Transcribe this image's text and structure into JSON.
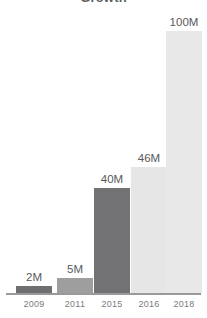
{
  "chart_data": {
    "type": "bar",
    "title": "Growth",
    "subtitle": "",
    "xlabel": "",
    "ylabel": "",
    "categories": [
      "2009",
      "2011",
      "2015",
      "2016",
      "2018"
    ],
    "values": [
      2,
      5,
      40,
      46,
      100
    ],
    "value_labels": [
      "2M",
      "5M",
      "40M",
      "46M",
      "100M"
    ],
    "unit": "M",
    "ylim": [
      0,
      100
    ],
    "grid": false,
    "legend": false,
    "legend_position": "none",
    "bar_colors": [
      "#6f6f71",
      "#9e9e9f",
      "#727274",
      "#e6e6e6",
      "#e8e8e8"
    ],
    "series": [
      {
        "name": "Growth",
        "values": [
          2,
          5,
          40,
          46,
          100
        ]
      }
    ]
  },
  "colors": {
    "background": "#ffffff",
    "axis_line": "#9a9a9c",
    "value_label": "#59595b",
    "tick_label": "#7b7b7d",
    "title": "#5e5e5e"
  },
  "axis": {
    "baseline_visible": true
  },
  "bars": [
    {
      "label": "2009",
      "value_label": "2M",
      "value": 2,
      "color": "#6f6f71",
      "height_px": 8,
      "left_px": 16
    },
    {
      "label": "2011",
      "value_label": "5M",
      "value": 5,
      "color": "#9e9e9f",
      "height_px": 16,
      "left_px": 57
    },
    {
      "label": "2015",
      "value_label": "40M",
      "value": 40,
      "color": "#727274",
      "height_px": 106,
      "left_px": 94
    },
    {
      "label": "2016",
      "value_label": "46M",
      "value": 46,
      "color": "#e6e6e6",
      "height_px": 127,
      "left_px": 131
    },
    {
      "label": "2018",
      "value_label": "100M",
      "value": 100,
      "color": "#e8e8e8",
      "height_px": 263,
      "left_px": 166
    }
  ]
}
